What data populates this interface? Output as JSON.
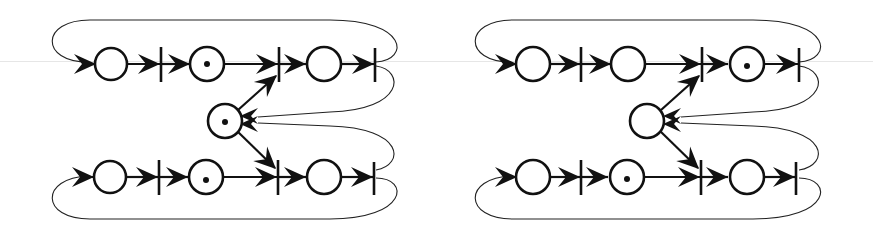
{
  "diagram": {
    "type": "petri-net",
    "nets": [
      {
        "id": "left",
        "places": [
          {
            "id": "p1",
            "row": "top",
            "tokens": 0
          },
          {
            "id": "p2",
            "row": "top",
            "tokens": 1
          },
          {
            "id": "p3",
            "row": "top",
            "tokens": 0
          },
          {
            "id": "pm",
            "row": "middle",
            "tokens": 1
          },
          {
            "id": "p4",
            "row": "bottom",
            "tokens": 0
          },
          {
            "id": "p5",
            "row": "bottom",
            "tokens": 1
          },
          {
            "id": "p6",
            "row": "bottom",
            "tokens": 0
          }
        ],
        "transitions": [
          "t1",
          "t2",
          "t3",
          "t4",
          "t5",
          "t6"
        ]
      },
      {
        "id": "right",
        "places": [
          {
            "id": "p1",
            "row": "top",
            "tokens": 0
          },
          {
            "id": "p2",
            "row": "top",
            "tokens": 0
          },
          {
            "id": "p3",
            "row": "top",
            "tokens": 1
          },
          {
            "id": "pm",
            "row": "middle",
            "tokens": 0
          },
          {
            "id": "p4",
            "row": "bottom",
            "tokens": 0
          },
          {
            "id": "p5",
            "row": "bottom",
            "tokens": 1
          },
          {
            "id": "p6",
            "row": "bottom",
            "tokens": 0
          }
        ],
        "transitions": [
          "t1",
          "t2",
          "t3",
          "t4",
          "t5",
          "t6"
        ]
      }
    ],
    "colors": {
      "stroke": "#111111",
      "background": "#ffffff"
    }
  }
}
